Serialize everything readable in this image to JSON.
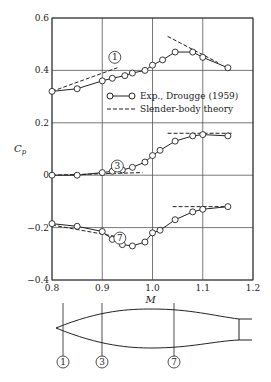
{
  "chart_data": {
    "type": "line",
    "title": "",
    "xlabel": "M",
    "ylabel": "C_p",
    "xlim": [
      0.8,
      1.2
    ],
    "ylim": [
      -0.4,
      0.6
    ],
    "x_ticks": [
      "0.8",
      "0.9",
      "1.0",
      "1.1",
      "1.2"
    ],
    "y_ticks": [
      "0.6",
      "0.4",
      "0.2",
      "0",
      "−0.2",
      "−0.4"
    ],
    "grid": true,
    "legend": {
      "position": "upper right (inside)",
      "entries": [
        "Exp., Drougge (1959)",
        "Slender-body theory"
      ]
    },
    "series": [
      {
        "name": "Station 1 (Exp.)",
        "label": "1",
        "x": [
          0.8,
          0.85,
          0.9,
          0.92,
          0.945,
          0.96,
          0.985,
          1.0,
          1.02,
          1.045,
          1.08,
          1.1,
          1.15
        ],
        "y": [
          0.32,
          0.33,
          0.36,
          0.37,
          0.38,
          0.39,
          0.4,
          0.42,
          0.44,
          0.47,
          0.47,
          0.45,
          0.41
        ]
      },
      {
        "name": "Station 3 (Exp.)",
        "label": "3",
        "x": [
          0.8,
          0.85,
          0.9,
          0.92,
          0.94,
          0.96,
          0.985,
          1.0,
          1.015,
          1.045,
          1.08,
          1.1,
          1.15
        ],
        "y": [
          0.0,
          0.0,
          0.01,
          0.015,
          0.02,
          0.03,
          0.05,
          0.075,
          0.095,
          0.13,
          0.15,
          0.155,
          0.15
        ]
      },
      {
        "name": "Station 7 (Exp.)",
        "label": "7",
        "x": [
          0.8,
          0.85,
          0.9,
          0.92,
          0.94,
          0.96,
          0.985,
          1.0,
          1.015,
          1.045,
          1.08,
          1.1,
          1.15
        ],
        "y": [
          -0.185,
          -0.195,
          -0.215,
          -0.245,
          -0.265,
          -0.27,
          -0.255,
          -0.22,
          -0.21,
          -0.17,
          -0.14,
          -0.13,
          -0.12
        ]
      },
      {
        "name": "Station 1 (Theory)",
        "segments": [
          {
            "x": [
              0.8,
              0.93
            ],
            "y": [
              0.32,
              0.41
            ]
          },
          {
            "x": [
              1.03,
              1.13
            ],
            "y": [
              0.53,
              0.43
            ]
          }
        ]
      },
      {
        "name": "Station 3 (Theory)",
        "segments": [
          {
            "x": [
              0.8,
              0.98
            ],
            "y": [
              0.0,
              0.01
            ]
          },
          {
            "x": [
              1.03,
              1.16
            ],
            "y": [
              0.16,
              0.16
            ]
          }
        ]
      },
      {
        "name": "Station 7 (Theory)",
        "segments": [
          {
            "x": [
              0.8,
              0.93
            ],
            "y": [
              -0.19,
              -0.235
            ]
          },
          {
            "x": [
              1.04,
              1.15
            ],
            "y": [
              -0.12,
              -0.12
            ]
          }
        ]
      }
    ],
    "annotations": [
      "1",
      "3",
      "7"
    ]
  },
  "body_diagram": {
    "description": "Slender body profile with station markers",
    "stations": [
      "1",
      "3",
      "7"
    ]
  }
}
